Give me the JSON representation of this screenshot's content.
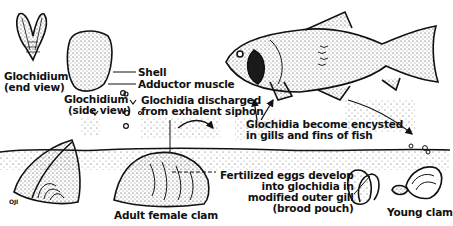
{
  "diagram": {
    "labels": {
      "glochidium_end_1": "Glochidium",
      "glochidium_end_2": "(end view)",
      "glochidium_side_1": "Glochidium",
      "glochidium_side_2": "(side view)",
      "shell": "Shell",
      "adductor": "Adductor muscle",
      "discharged_1": "Glochidia discharged",
      "discharged_2": "from exhalent siphon",
      "encysted_1": "Glochidia become encysted",
      "encysted_2": "in gills and fins of fish",
      "eggs_1": "Fertilized eggs develop",
      "eggs_2": "into glochidia in",
      "eggs_3": "modified outer gill",
      "eggs_4": "(brood pouch)",
      "adult": "Adult female clam",
      "young": "Young clam",
      "signature": "OJI"
    },
    "colors": {
      "ink": "#111111",
      "background": "#ffffff"
    }
  }
}
